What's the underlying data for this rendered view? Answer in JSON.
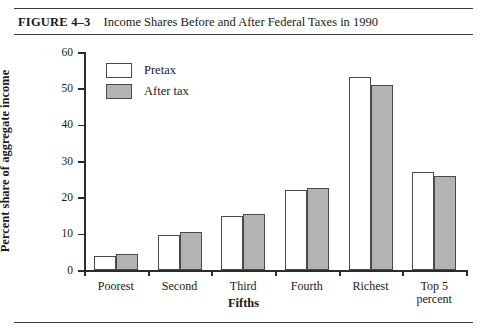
{
  "figure": {
    "label": "FIGURE 4–3",
    "title": "Income Shares Before and After Federal Taxes in 1990"
  },
  "chart_data": {
    "type": "bar",
    "title": "Income Shares Before and After Federal Taxes in 1990",
    "xlabel": "Fifths",
    "ylabel": "Percent share of aggregate income",
    "categories": [
      "Poorest",
      "Second",
      "Third",
      "Fourth",
      "Richest",
      "Top 5\npercent"
    ],
    "series": [
      {
        "name": "Pretax",
        "color": "#ffffff",
        "values": [
          3.8,
          9.5,
          15.0,
          22.0,
          53.0,
          27.0
        ]
      },
      {
        "name": "After tax",
        "color": "#b3b3b3",
        "values": [
          4.4,
          10.5,
          15.5,
          22.5,
          51.0,
          25.8
        ]
      }
    ],
    "ylim": [
      0,
      60
    ],
    "yticks": [
      0,
      10,
      20,
      30,
      40,
      50,
      60
    ],
    "ytick_labels": [
      "0",
      "10",
      "20",
      "30",
      "40",
      "50",
      "60"
    ],
    "grid": false,
    "legend_position": "upper-left-inside"
  }
}
